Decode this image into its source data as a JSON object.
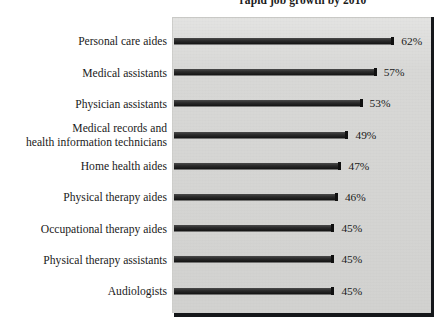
{
  "chart_data": {
    "type": "bar",
    "orientation": "horizontal",
    "title": "rapid job growth by 2010",
    "xlabel": "",
    "ylabel": "",
    "xlim": [
      0,
      70
    ],
    "grid": false,
    "legend": null,
    "value_suffix": "%",
    "categories": [
      "Personal care aides",
      "Medical assistants",
      "Physician assistants",
      "Medical records and health information technicians",
      "Home health aides",
      "Physical therapy aides",
      "Occupational therapy aides",
      "Physical therapy assistants",
      "Audiologists"
    ],
    "values": [
      62,
      57,
      53,
      49,
      47,
      46,
      45,
      45,
      45
    ],
    "value_labels": [
      "62%",
      "57%",
      "53%",
      "49%",
      "47%",
      "46%",
      "45%",
      "45%",
      "45%"
    ],
    "colors": {
      "bar": "#1d1d1d",
      "plot_background": "#d6d6d4",
      "frame_shadow": "#15171a",
      "text": "#1a1a1a",
      "page_background": "#ffffff"
    }
  },
  "rows": [
    {
      "label_line1": "Personal care aides",
      "label_line2": "",
      "value_label": "62%"
    },
    {
      "label_line1": "Medical assistants",
      "label_line2": "",
      "value_label": "57%"
    },
    {
      "label_line1": "Physician assistants",
      "label_line2": "",
      "value_label": "53%"
    },
    {
      "label_line1": "Medical records and",
      "label_line2": "health information technicians",
      "value_label": "49%"
    },
    {
      "label_line1": "Home health aides",
      "label_line2": "",
      "value_label": "47%"
    },
    {
      "label_line1": "Physical therapy aides",
      "label_line2": "",
      "value_label": "46%"
    },
    {
      "label_line1": "Occupational therapy aides",
      "label_line2": "",
      "value_label": "45%"
    },
    {
      "label_line1": "Physical therapy assistants",
      "label_line2": "",
      "value_label": "45%"
    },
    {
      "label_line1": "Audiologists",
      "label_line2": "",
      "value_label": "45%"
    }
  ]
}
